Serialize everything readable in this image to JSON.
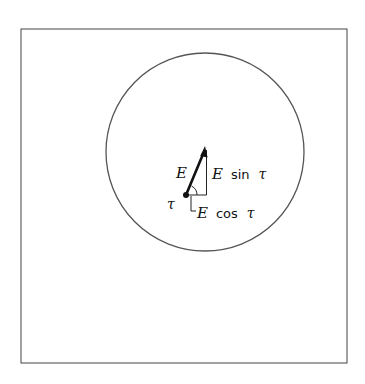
{
  "diagram": {
    "frame": {
      "x": 21,
      "y": 29,
      "width": 326,
      "height": 334
    },
    "circle": {
      "cx": 205,
      "cy": 152,
      "r": 99
    },
    "vector": {
      "origin": {
        "x": 186,
        "y": 195
      },
      "tip": {
        "x": 205,
        "y": 148
      },
      "label": "E"
    },
    "components": {
      "vertical": {
        "label_var": "E",
        "label_fn": "sin",
        "label_angle": "τ"
      },
      "horizontal": {
        "label_var": "E",
        "label_fn": "cos",
        "label_angle": "τ"
      }
    },
    "angle_label": "τ",
    "colors": {
      "stroke": "#111111",
      "frame": "#555555",
      "background": "#ffffff"
    }
  }
}
